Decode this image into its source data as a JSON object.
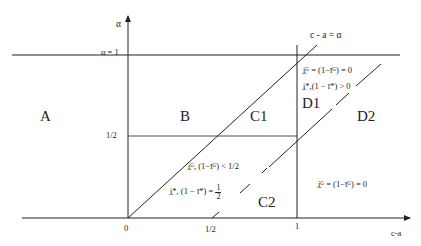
{
  "axes": {
    "y_label": "α",
    "x_label": "c-a",
    "y_tick_alpha1": "α = 1",
    "y_tick_half": "1/2",
    "x_tick_zero": "0",
    "x_tick_half": "1/2",
    "x_tick_one": "1"
  },
  "lines": {
    "diagonal_label": "c - a = α"
  },
  "regions": {
    "A": "A",
    "B": "B",
    "C1": "C1",
    "C2": "C2",
    "D1": "D1",
    "D2": "D2"
  },
  "annotations": {
    "d1_line1": "i̲ᴳ = (1−īᴳ) = 0",
    "d1_line2": "i̲*,(1 − ī*) > 0",
    "c2_line1": "i̲ᴳ, (1−īᴳ) < 1/2",
    "c2_line2_prefix": "i̲*, (1 − ī*) =",
    "c2_line2_num": "1",
    "c2_line2_den": "2",
    "d2_line1": "i̲ᴳ = (1−īᴳ) = 0"
  },
  "colors": {
    "line": "#222222",
    "background": "#ffffff"
  }
}
